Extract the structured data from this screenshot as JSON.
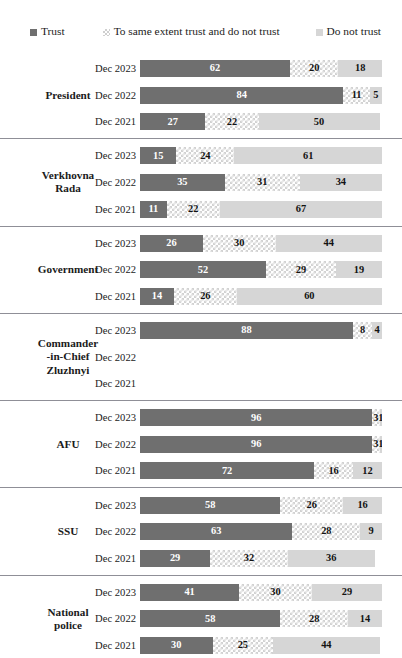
{
  "legend": {
    "items": [
      {
        "key": "trust",
        "label": "Trust",
        "color": "#6f6f6f",
        "swatch": "trust-swatch-icon"
      },
      {
        "key": "mixed",
        "label": "To same extent trust and do not trust",
        "color": "#d2d2d2",
        "swatch": "mixed-swatch-icon"
      },
      {
        "key": "notrust",
        "label": "Do not trust",
        "color": "#d6d6d6",
        "swatch": "notrust-swatch-icon"
      }
    ]
  },
  "colors": {
    "trust": "#6f6f6f",
    "mixed": "#d2d2d2",
    "notrust": "#d6d6d6",
    "separator": "#8f8f97",
    "text": "#1b1b1b",
    "background": "#ffffff"
  },
  "chart_data": {
    "type": "bar",
    "subtype": "stacked-horizontal-100",
    "title": "",
    "subtitle": "",
    "xlabel": "",
    "ylabel": "",
    "xlim": [
      0,
      100
    ],
    "grid": false,
    "legend_position": "top",
    "series": [
      {
        "name": "Trust",
        "key": "trust"
      },
      {
        "name": "To same extent trust and do not trust",
        "key": "mixed"
      },
      {
        "name": "Do not trust",
        "key": "notrust"
      }
    ],
    "periods": [
      "Dec 2023",
      "Dec 2022",
      "Dec 2021"
    ],
    "groups": [
      {
        "category": "President",
        "label_lines": [
          "President"
        ],
        "rows": [
          {
            "period": "Dec 2023",
            "trust": 62,
            "mixed": 20,
            "notrust": 18,
            "empty": false
          },
          {
            "period": "Dec 2022",
            "trust": 84,
            "mixed": 11,
            "notrust": 5,
            "empty": false
          },
          {
            "period": "Dec 2021",
            "trust": 27,
            "mixed": 22,
            "notrust": 50,
            "empty": false
          }
        ]
      },
      {
        "category": "Verkhovna Rada",
        "label_lines": [
          "Verkhovna",
          "Rada"
        ],
        "rows": [
          {
            "period": "Dec 2023",
            "trust": 15,
            "mixed": 24,
            "notrust": 61,
            "empty": false
          },
          {
            "period": "Dec 2022",
            "trust": 35,
            "mixed": 31,
            "notrust": 34,
            "empty": false
          },
          {
            "period": "Dec 2021",
            "trust": 11,
            "mixed": 22,
            "notrust": 67,
            "empty": false
          }
        ]
      },
      {
        "category": "Government",
        "label_lines": [
          "Government"
        ],
        "rows": [
          {
            "period": "Dec 2023",
            "trust": 26,
            "mixed": 30,
            "notrust": 44,
            "empty": false
          },
          {
            "period": "Dec 2022",
            "trust": 52,
            "mixed": 29,
            "notrust": 19,
            "empty": false
          },
          {
            "period": "Dec 2021",
            "trust": 14,
            "mixed": 26,
            "notrust": 60,
            "empty": false
          }
        ]
      },
      {
        "category": "Commander-in-Chief Zluzhnyi",
        "label_lines": [
          "Commander",
          "-in-Chief",
          "Zluzhnyi"
        ],
        "rows": [
          {
            "period": "Dec 2023",
            "trust": 88,
            "mixed": 8,
            "notrust": 4,
            "empty": false
          },
          {
            "period": "Dec 2022",
            "trust": null,
            "mixed": null,
            "notrust": null,
            "empty": true
          },
          {
            "period": "Dec 2021",
            "trust": null,
            "mixed": null,
            "notrust": null,
            "empty": true
          }
        ]
      },
      {
        "category": "AFU",
        "label_lines": [
          "AFU"
        ],
        "rows": [
          {
            "period": "Dec 2023",
            "trust": 96,
            "mixed": 3,
            "notrust": 1,
            "empty": false
          },
          {
            "period": "Dec 2022",
            "trust": 96,
            "mixed": 3,
            "notrust": 1,
            "empty": false
          },
          {
            "period": "Dec 2021",
            "trust": 72,
            "mixed": 16,
            "notrust": 12,
            "empty": false
          }
        ]
      },
      {
        "category": "SSU",
        "label_lines": [
          "SSU"
        ],
        "rows": [
          {
            "period": "Dec 2023",
            "trust": 58,
            "mixed": 26,
            "notrust": 16,
            "empty": false
          },
          {
            "period": "Dec 2022",
            "trust": 63,
            "mixed": 28,
            "notrust": 9,
            "empty": false
          },
          {
            "period": "Dec 2021",
            "trust": 29,
            "mixed": 32,
            "notrust": 36,
            "empty": false
          }
        ]
      },
      {
        "category": "National police",
        "label_lines": [
          "National",
          "police"
        ],
        "rows": [
          {
            "period": "Dec 2023",
            "trust": 41,
            "mixed": 30,
            "notrust": 29,
            "empty": false
          },
          {
            "period": "Dec 2022",
            "trust": 58,
            "mixed": 28,
            "notrust": 14,
            "empty": false
          },
          {
            "period": "Dec 2021",
            "trust": 30,
            "mixed": 25,
            "notrust": 44,
            "empty": false
          }
        ]
      }
    ]
  }
}
